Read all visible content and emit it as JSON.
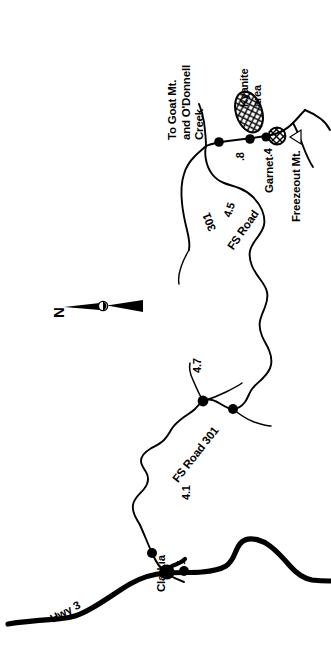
{
  "map": {
    "orientation_note": "labels rotated 90 degrees (read sideways)",
    "title_lines": [
      "To Goat Mt.",
      "and O'Donnell",
      "Creek"
    ],
    "compass": {
      "label": "N",
      "icon": "north-arrow-icon"
    },
    "places": [
      {
        "id": "clarkia",
        "name": "Clarkia"
      },
      {
        "id": "freezeout",
        "name": "Freezeout Mt."
      },
      {
        "id": "garnet",
        "name": "Garnet"
      }
    ],
    "areas": [
      {
        "id": "kyanite",
        "line1": "Kyanite",
        "line2": "area"
      }
    ],
    "roads": [
      {
        "id": "hwy3",
        "name": "Hwy 3",
        "style": "thick"
      },
      {
        "id": "fsroad301-lower",
        "name": "FS Road 301",
        "style": "thin"
      },
      {
        "id": "fsroad301-upper",
        "name": "FS Road",
        "number": "301",
        "style": "thin"
      }
    ],
    "mileage_markers": [
      {
        "id": "m1",
        "label": "1"
      },
      {
        "id": "m41",
        "label": "4.1"
      },
      {
        "id": "m47",
        "label": "4.7"
      },
      {
        "id": "m45",
        "label": "4.5"
      },
      {
        "id": "m08",
        "label": ".8"
      },
      {
        "id": "m04",
        "label": ".4"
      }
    ],
    "symbols": [
      {
        "id": "kyanite-ellipse",
        "icon": "cross-hatched-ellipse-icon",
        "meaning": "kyanite collecting area"
      },
      {
        "id": "garnet-circle",
        "icon": "cross-hatched-circle-icon",
        "meaning": "garnet collecting area"
      },
      {
        "id": "peak-marker",
        "icon": "triangle-peak-icon",
        "meaning": "mountain summit"
      },
      {
        "id": "junction-dots",
        "icon": "filled-dot-icon",
        "meaning": "road junction / mileage point"
      },
      {
        "id": "town-dot",
        "icon": "large-filled-dot-icon",
        "meaning": "town"
      }
    ],
    "colors": {
      "ink": "#000000",
      "paper": "#ffffff"
    }
  }
}
